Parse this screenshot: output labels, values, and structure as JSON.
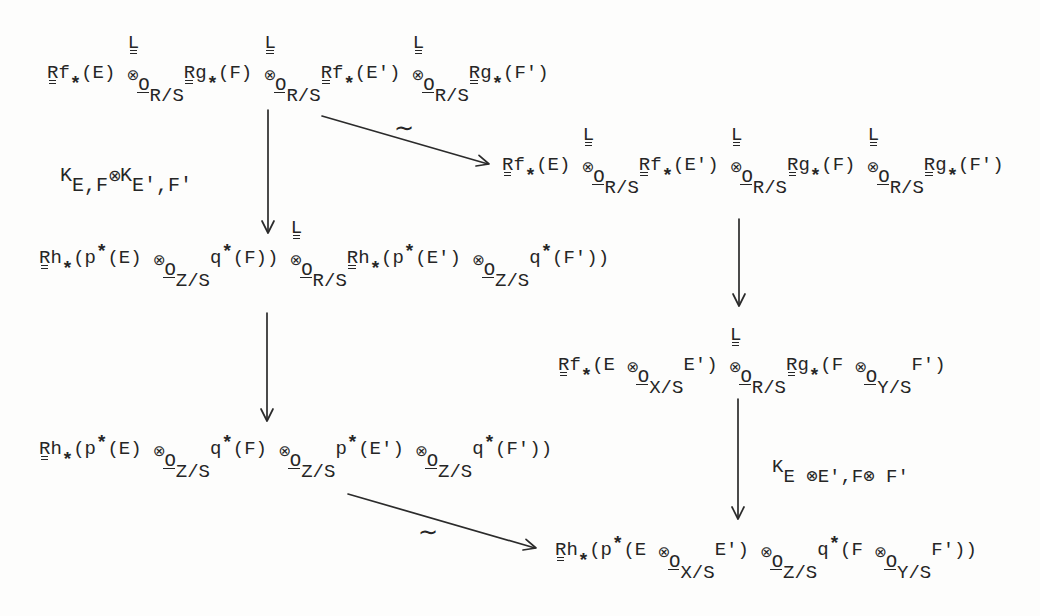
{
  "colors": {
    "ink": "#262626",
    "paper": "#fdfdfc"
  },
  "diagram": {
    "nodes": {
      "top": {
        "tokens": [
          {
            "k": "R",
            "v": "R"
          },
          {
            "k": "t",
            "v": "f"
          },
          {
            "k": "lo",
            "v": "*"
          },
          {
            "k": "t",
            "v": "(E) "
          },
          {
            "k": "ox",
            "v": "⊗",
            "o": "O",
            "sub": "R/S",
            "L": "L"
          },
          {
            "k": "R",
            "v": "R"
          },
          {
            "k": "t",
            "v": "g"
          },
          {
            "k": "lo",
            "v": "*"
          },
          {
            "k": "t",
            "v": "(F) "
          },
          {
            "k": "ox",
            "v": "⊗",
            "o": "O",
            "sub": "R/S",
            "L": "L"
          },
          {
            "k": "R",
            "v": "R"
          },
          {
            "k": "t",
            "v": "f"
          },
          {
            "k": "lo",
            "v": "*"
          },
          {
            "k": "t",
            "v": "(E') "
          },
          {
            "k": "ox",
            "v": "⊗",
            "o": "O",
            "sub": "R/S",
            "L": "L"
          },
          {
            "k": "R",
            "v": "R"
          },
          {
            "k": "t",
            "v": "g"
          },
          {
            "k": "lo",
            "v": "*"
          },
          {
            "k": "t",
            "v": "(F')"
          }
        ]
      },
      "right_1": {
        "tokens": [
          {
            "k": "R",
            "v": "R"
          },
          {
            "k": "t",
            "v": "f"
          },
          {
            "k": "lo",
            "v": "*"
          },
          {
            "k": "t",
            "v": "(E) "
          },
          {
            "k": "ox",
            "v": "⊗",
            "o": "O",
            "sub": "R/S",
            "L": "L"
          },
          {
            "k": "R",
            "v": "R"
          },
          {
            "k": "t",
            "v": "f"
          },
          {
            "k": "lo",
            "v": "*"
          },
          {
            "k": "t",
            "v": "(E') "
          },
          {
            "k": "ox",
            "v": "⊗",
            "o": "O",
            "sub": "R/S",
            "L": "L"
          },
          {
            "k": "R",
            "v": "R"
          },
          {
            "k": "t",
            "v": "g"
          },
          {
            "k": "lo",
            "v": "*"
          },
          {
            "k": "t",
            "v": "(F) "
          },
          {
            "k": "ox",
            "v": "⊗",
            "o": "O",
            "sub": "R/S",
            "L": "L"
          },
          {
            "k": "R",
            "v": "R"
          },
          {
            "k": "t",
            "v": "g"
          },
          {
            "k": "lo",
            "v": "*"
          },
          {
            "k": "t",
            "v": "(F')"
          }
        ]
      },
      "left_2": {
        "tokens": [
          {
            "k": "R",
            "v": "R"
          },
          {
            "k": "t",
            "v": "h"
          },
          {
            "k": "lo",
            "v": "*"
          },
          {
            "k": "t",
            "v": "(p"
          },
          {
            "k": "hi",
            "v": "*"
          },
          {
            "k": "t",
            "v": "(E) "
          },
          {
            "k": "ox",
            "v": "⊗",
            "o": "O",
            "sub": "Z/S"
          },
          {
            "k": "t",
            "v": "q"
          },
          {
            "k": "hi",
            "v": "*"
          },
          {
            "k": "t",
            "v": "(F)) "
          },
          {
            "k": "ox",
            "v": "⊗",
            "o": "O",
            "sub": "R/S",
            "L": "L"
          },
          {
            "k": "R",
            "v": "R"
          },
          {
            "k": "t",
            "v": "h"
          },
          {
            "k": "lo",
            "v": "*"
          },
          {
            "k": "t",
            "v": "(p"
          },
          {
            "k": "hi",
            "v": "*"
          },
          {
            "k": "t",
            "v": "(E') "
          },
          {
            "k": "ox",
            "v": "⊗",
            "o": "O",
            "sub": "Z/S"
          },
          {
            "k": "t",
            "v": "q"
          },
          {
            "k": "hi",
            "v": "*"
          },
          {
            "k": "t",
            "v": "(F'))"
          }
        ]
      },
      "right_2": {
        "tokens": [
          {
            "k": "R",
            "v": "R"
          },
          {
            "k": "t",
            "v": "f"
          },
          {
            "k": "lo",
            "v": "*"
          },
          {
            "k": "t",
            "v": "(E "
          },
          {
            "k": "ox",
            "v": "⊗",
            "o": "O",
            "sub": "X/S"
          },
          {
            "k": "t",
            "v": "E') "
          },
          {
            "k": "ox",
            "v": "⊗",
            "o": "O",
            "sub": "R/S",
            "L": "L"
          },
          {
            "k": "R",
            "v": "R"
          },
          {
            "k": "t",
            "v": "g"
          },
          {
            "k": "lo",
            "v": "*"
          },
          {
            "k": "t",
            "v": "(F "
          },
          {
            "k": "ox",
            "v": "⊗",
            "o": "O",
            "sub": "Y/S"
          },
          {
            "k": "t",
            "v": "F')"
          }
        ]
      },
      "left_3": {
        "tokens": [
          {
            "k": "R",
            "v": "R"
          },
          {
            "k": "t",
            "v": "h"
          },
          {
            "k": "lo",
            "v": "*"
          },
          {
            "k": "t",
            "v": "(p"
          },
          {
            "k": "hi",
            "v": "*"
          },
          {
            "k": "t",
            "v": "(E) "
          },
          {
            "k": "ox",
            "v": "⊗",
            "o": "O",
            "sub": "Z/S"
          },
          {
            "k": "t",
            "v": "q"
          },
          {
            "k": "hi",
            "v": "*"
          },
          {
            "k": "t",
            "v": "(F) "
          },
          {
            "k": "ox",
            "v": "⊗",
            "o": "O",
            "sub": "Z/S"
          },
          {
            "k": "t",
            "v": "p"
          },
          {
            "k": "hi",
            "v": "*"
          },
          {
            "k": "t",
            "v": "(E') "
          },
          {
            "k": "ox",
            "v": "⊗",
            "o": "O",
            "sub": "Z/S"
          },
          {
            "k": "t",
            "v": "q"
          },
          {
            "k": "hi",
            "v": "*"
          },
          {
            "k": "t",
            "v": "(F'))"
          }
        ]
      },
      "bottom": {
        "tokens": [
          {
            "k": "R",
            "v": "R"
          },
          {
            "k": "t",
            "v": "h"
          },
          {
            "k": "lo",
            "v": "*"
          },
          {
            "k": "t",
            "v": "(p"
          },
          {
            "k": "hi",
            "v": "*"
          },
          {
            "k": "t",
            "v": "(E "
          },
          {
            "k": "ox",
            "v": "⊗",
            "o": "O",
            "sub": "X/S"
          },
          {
            "k": "t",
            "v": "E') "
          },
          {
            "k": "ox",
            "v": "⊗",
            "o": "O",
            "sub": "Z/S"
          },
          {
            "k": "t",
            "v": "q"
          },
          {
            "k": "hi",
            "v": "*"
          },
          {
            "k": "t",
            "v": "(F "
          },
          {
            "k": "ox",
            "v": "⊗",
            "o": "O",
            "sub": "Y/S"
          },
          {
            "k": "t",
            "v": "F'))"
          }
        ]
      }
    },
    "edges": {
      "top_to_left_2": {
        "label_tokens": [
          {
            "k": "t",
            "v": "K"
          },
          {
            "k": "sub",
            "v": "E,F"
          },
          {
            "k": "op",
            "v": "⊗"
          },
          {
            "k": "t",
            "v": "K"
          },
          {
            "k": "sub",
            "v": "E',F'"
          }
        ]
      },
      "top_to_right_1": {
        "label": "∼"
      },
      "left_2_to_left_3": {
        "label": ""
      },
      "right_1_to_right_2": {
        "label": ""
      },
      "right_2_to_bottom": {
        "label_tokens": [
          {
            "k": "t",
            "v": "K"
          },
          {
            "k": "sub",
            "v": "E ⊗E',F⊗ F'"
          }
        ]
      },
      "left_3_to_bottom": {
        "label": "∼"
      }
    }
  }
}
